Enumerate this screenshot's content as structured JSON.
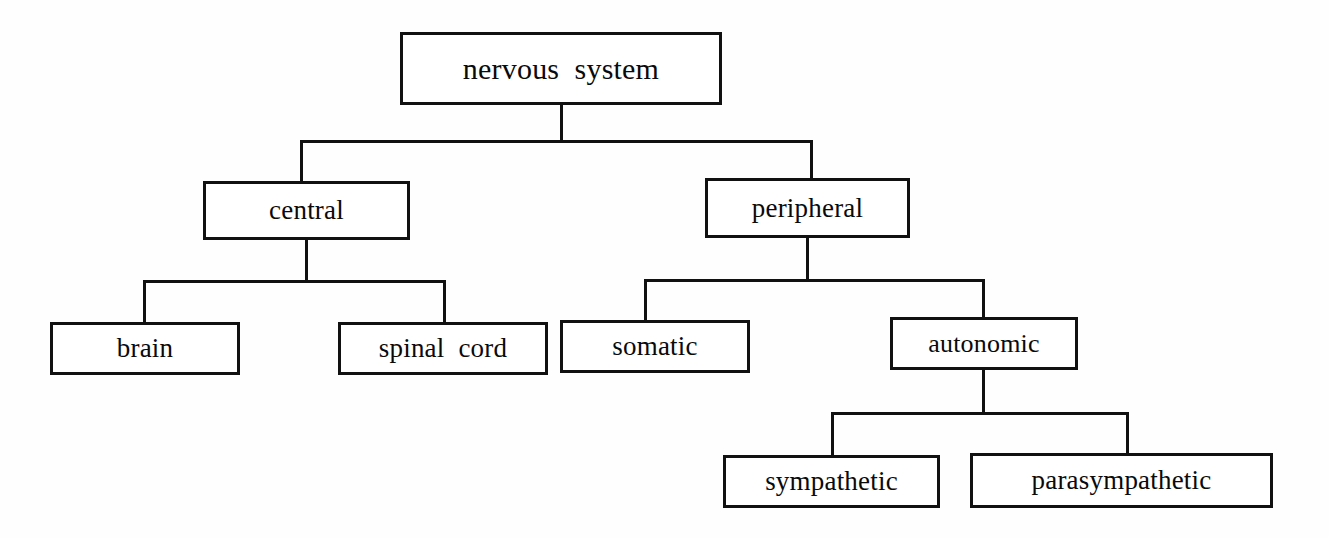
{
  "diagram": {
    "type": "tree-hierarchy",
    "background_color": "#fefefe",
    "line_color": "#111111",
    "text_color": "#0a0a0a",
    "nodes": [
      {
        "id": "nervous-system",
        "label": "nervous  system",
        "level": 0,
        "x": 400,
        "y": 32,
        "w": 322,
        "h": 73,
        "font_size": 30
      },
      {
        "id": "central",
        "label": "central",
        "level": 1,
        "x": 203,
        "y": 181,
        "w": 207,
        "h": 59,
        "font_size": 27
      },
      {
        "id": "peripheral",
        "label": "peripheral",
        "level": 1,
        "x": 705,
        "y": 178,
        "w": 205,
        "h": 60,
        "font_size": 27
      },
      {
        "id": "brain",
        "label": "brain",
        "level": 2,
        "x": 50,
        "y": 322,
        "w": 190,
        "h": 53,
        "font_size": 27
      },
      {
        "id": "spinal-cord",
        "label": "spinal  cord",
        "level": 2,
        "x": 338,
        "y": 322,
        "w": 210,
        "h": 53,
        "font_size": 27
      },
      {
        "id": "somatic",
        "label": "somatic",
        "level": 2,
        "x": 560,
        "y": 320,
        "w": 190,
        "h": 53,
        "font_size": 27
      },
      {
        "id": "autonomic",
        "label": "autonomic",
        "level": 2,
        "x": 890,
        "y": 317,
        "w": 188,
        "h": 53,
        "font_size": 26
      },
      {
        "id": "sympathetic",
        "label": "sympathetic",
        "level": 3,
        "x": 723,
        "y": 455,
        "w": 217,
        "h": 53,
        "font_size": 27
      },
      {
        "id": "parasympathetic",
        "label": "parasympathetic",
        "level": 3,
        "x": 970,
        "y": 453,
        "w": 303,
        "h": 55,
        "font_size": 27
      }
    ],
    "edges": [
      {
        "id": "edge-root-stem",
        "from": "nervous-system",
        "orient": "vertical",
        "x": 560,
        "y": 105,
        "len": 38
      },
      {
        "id": "edge-root-bar",
        "from": "nervous-system",
        "orient": "horizontal",
        "x": 300,
        "y": 140,
        "len": 513
      },
      {
        "id": "edge-to-central",
        "to": "central",
        "orient": "vertical",
        "x": 300,
        "y": 140,
        "len": 43
      },
      {
        "id": "edge-to-peripheral",
        "to": "peripheral",
        "orient": "vertical",
        "x": 810,
        "y": 140,
        "len": 40
      },
      {
        "id": "edge-central-stem",
        "from": "central",
        "orient": "vertical",
        "x": 305,
        "y": 240,
        "len": 42
      },
      {
        "id": "edge-central-bar",
        "from": "central",
        "orient": "horizontal",
        "x": 143,
        "y": 280,
        "len": 303
      },
      {
        "id": "edge-to-brain",
        "to": "brain",
        "orient": "vertical",
        "x": 143,
        "y": 280,
        "len": 44
      },
      {
        "id": "edge-to-spinal-cord",
        "to": "spinal-cord",
        "orient": "vertical",
        "x": 443,
        "y": 280,
        "len": 44
      },
      {
        "id": "edge-peripheral-stem",
        "from": "peripheral",
        "orient": "vertical",
        "x": 806,
        "y": 238,
        "len": 43
      },
      {
        "id": "edge-peripheral-bar",
        "from": "peripheral",
        "orient": "horizontal",
        "x": 644,
        "y": 279,
        "len": 341
      },
      {
        "id": "edge-to-somatic",
        "to": "somatic",
        "orient": "vertical",
        "x": 644,
        "y": 279,
        "len": 44
      },
      {
        "id": "edge-to-autonomic",
        "to": "autonomic",
        "orient": "vertical",
        "x": 982,
        "y": 279,
        "len": 41
      },
      {
        "id": "edge-autonomic-stem",
        "from": "autonomic",
        "orient": "vertical",
        "x": 982,
        "y": 370,
        "len": 45
      },
      {
        "id": "edge-autonomic-bar",
        "from": "autonomic",
        "orient": "horizontal",
        "x": 831,
        "y": 412,
        "len": 298
      },
      {
        "id": "edge-to-sympathetic",
        "to": "sympathetic",
        "orient": "vertical",
        "x": 831,
        "y": 412,
        "len": 46
      },
      {
        "id": "edge-to-parasympathetic",
        "to": "parasympathetic",
        "orient": "vertical",
        "x": 1126,
        "y": 412,
        "len": 44
      }
    ]
  }
}
